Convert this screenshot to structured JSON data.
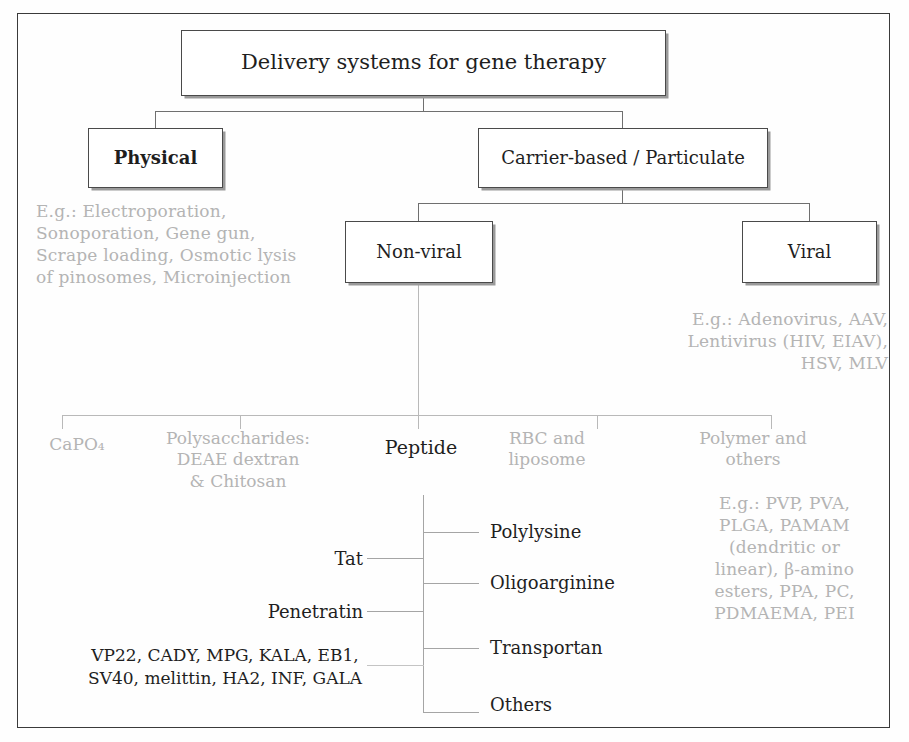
{
  "diagram": {
    "title": "Delivery systems for gene therapy",
    "nodes": {
      "root": "Delivery systems for gene therapy",
      "physical": "Physical",
      "carrier": "Carrier-based / Particulate",
      "nonviral": "Non-viral",
      "viral": "Viral"
    },
    "examples": {
      "physical": "E.g.: Electroporation,\nSonoporation, Gene gun,\nScrape loading, Osmotic lysis\nof pinosomes, Microinjection",
      "viral": "E.g.: Adenovirus, AAV,\nLentivirus (HIV, EIAV),\nHSV, MLV",
      "polymer": "E.g.: PVP, PVA,\nPLGA, PAMAM\n(dendritic or\nlinear), β-amino\nesters, PPA, PC,\nPDMAEMA, PEI"
    },
    "nonviral_categories": [
      {
        "id": "capo4",
        "label": "CaPO₄",
        "emphasis": "faint"
      },
      {
        "id": "polysaccharides",
        "label": "Polysaccharides:\nDEAE dextran\n& Chitosan",
        "emphasis": "faint"
      },
      {
        "id": "peptide",
        "label": "Peptide",
        "emphasis": "dark"
      },
      {
        "id": "rbc-liposome",
        "label": "RBC and\nliposome",
        "emphasis": "faint"
      },
      {
        "id": "polymer-others",
        "label": "Polymer and\nothers",
        "emphasis": "faint"
      }
    ],
    "peptide_children_right": [
      {
        "id": "polylysine",
        "label": "Polylysine"
      },
      {
        "id": "oligoarginine",
        "label": "Oligoarginine"
      },
      {
        "id": "transportan",
        "label": "Transportan"
      },
      {
        "id": "others",
        "label": "Others"
      }
    ],
    "peptide_children_left": [
      {
        "id": "tat",
        "label": "Tat"
      },
      {
        "id": "penetratin",
        "label": "Penetratin"
      }
    ],
    "peptide_others_list": "VP22, CADY, MPG, KALA, EB1,\nSV40, melittin, HA2, INF, GALA"
  },
  "colors": {
    "frame": "#3a3a3a",
    "box_border": "#4a4a4a",
    "box_shadow": "#9a9a9a",
    "connector": "#8a8a8a",
    "text_dark": "#1f1f1f",
    "text_faint": "#b4b4b4"
  }
}
